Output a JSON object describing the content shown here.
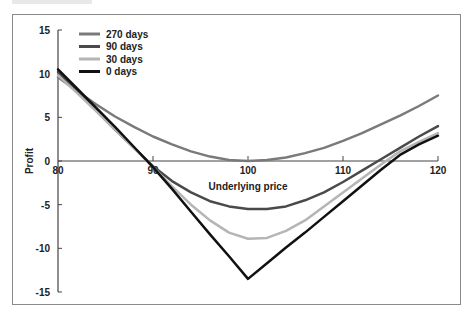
{
  "chart_data": {
    "type": "line",
    "title": "",
    "xlabel": "Underlying price",
    "ylabel": "Profit",
    "xlim": [
      80,
      120
    ],
    "ylim": [
      -15,
      15
    ],
    "x_ticks": [
      80,
      90,
      100,
      110,
      120
    ],
    "y_ticks": [
      15,
      10,
      5,
      0,
      -5,
      -10,
      -15
    ],
    "grid": false,
    "legend_position": "upper-left",
    "x": [
      80,
      82,
      84,
      86,
      88,
      90,
      92,
      94,
      96,
      98,
      100,
      102,
      104,
      106,
      108,
      110,
      112,
      114,
      116,
      118,
      120
    ],
    "series": [
      {
        "name": "270 days",
        "color": "#7a7a7a",
        "width": 2.5,
        "values": [
          9.6,
          8.0,
          6.5,
          5.1,
          3.9,
          2.8,
          1.9,
          1.1,
          0.5,
          0.1,
          0.0,
          0.1,
          0.4,
          0.9,
          1.5,
          2.3,
          3.2,
          4.2,
          5.2,
          6.3,
          7.5
        ]
      },
      {
        "name": "90 days",
        "color": "#4a4a4a",
        "width": 2.5,
        "values": [
          10.2,
          8.0,
          5.8,
          3.6,
          1.5,
          -0.6,
          -2.3,
          -3.6,
          -4.6,
          -5.2,
          -5.5,
          -5.5,
          -5.2,
          -4.5,
          -3.6,
          -2.4,
          -1.1,
          0.2,
          1.5,
          2.8,
          4.0
        ]
      },
      {
        "name": "30 days",
        "color": "#b5b5b5",
        "width": 2.5,
        "values": [
          9.8,
          7.8,
          5.7,
          3.6,
          1.5,
          -0.7,
          -2.9,
          -5.0,
          -6.8,
          -8.2,
          -8.9,
          -8.8,
          -8.0,
          -6.8,
          -5.2,
          -3.6,
          -2.0,
          -0.4,
          1.1,
          2.2,
          3.2
        ]
      },
      {
        "name": "0 days",
        "color": "#111111",
        "width": 2.5,
        "values": [
          10.5,
          8.3,
          6.1,
          3.9,
          1.6,
          -0.7,
          -3.2,
          -5.8,
          -8.4,
          -10.9,
          -13.5,
          -11.7,
          -9.9,
          -8.2,
          -6.4,
          -4.6,
          -2.8,
          -1.0,
          0.7,
          1.9,
          2.9
        ]
      }
    ]
  },
  "legend": {
    "items": [
      {
        "label": "270 days"
      },
      {
        "label": "90 days"
      },
      {
        "label": "30 days"
      },
      {
        "label": "0 days"
      }
    ]
  }
}
